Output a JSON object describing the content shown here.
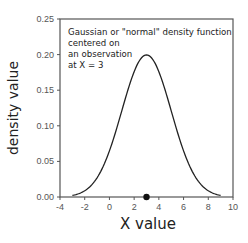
{
  "chart_data": {
    "type": "line",
    "title": "",
    "xlabel": "X value",
    "ylabel": "density value",
    "xlim": [
      -4,
      10
    ],
    "ylim": [
      0,
      0.25
    ],
    "grid": false,
    "legend": null,
    "xticks": [
      -4,
      -2,
      0,
      2,
      4,
      6,
      8,
      10
    ],
    "xtick_labels": [
      "-4",
      "-2",
      "0",
      "2",
      "4",
      "6",
      "8",
      "10"
    ],
    "yticks": [
      0.0,
      0.05,
      0.1,
      0.15,
      0.2,
      0.25
    ],
    "ytick_labels": [
      "0.00",
      "0.05",
      "0.10",
      "0.15",
      "0.20",
      "0.25"
    ],
    "series": [
      {
        "name": "Gaussian density",
        "distribution": "normal",
        "mean": 3,
        "sd": 2,
        "x_range": [
          -3,
          9
        ],
        "peak": {
          "x": 3,
          "y": 0.1995
        }
      }
    ],
    "points": [
      {
        "x": 3,
        "y": 0,
        "label": "observation"
      }
    ],
    "annotations": [
      "Gaussian or \"normal\" density function",
      "centered on",
      "an observation",
      "at X = 3"
    ]
  }
}
